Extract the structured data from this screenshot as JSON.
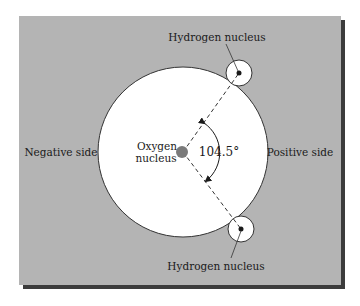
{
  "diagram": {
    "type": "water-molecule-polarity",
    "labels": {
      "hydrogen_top": "Hydrogen nucleus",
      "hydrogen_bottom": "Hydrogen nucleus",
      "oxygen_line1": "Oxygen",
      "oxygen_line2": "nucleus",
      "negative_side": "Negative side",
      "positive_side": "Positive side",
      "bond_angle": "104.5°"
    },
    "colors": {
      "panel_background": "#b4b4b4",
      "panel_shadow": "#3c3c3c",
      "electron_cloud": "#ffffff",
      "oxygen_nucleus": "#7a7a7a",
      "hydrogen_nucleus": "#1a1a1a",
      "outline": "#333333"
    }
  }
}
